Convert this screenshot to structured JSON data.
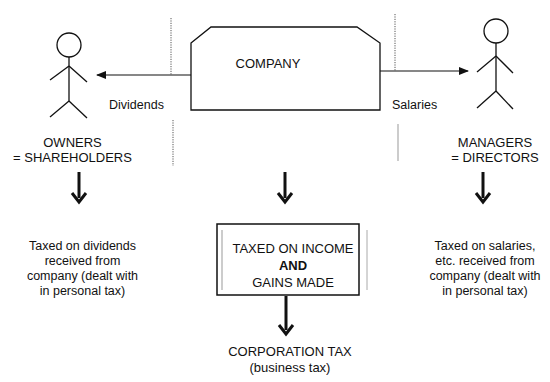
{
  "company": {
    "label": "COMPANY"
  },
  "flows": {
    "dividends_label": "Dividends",
    "salaries_label": "Salaries"
  },
  "owners": {
    "label_line1": "OWNERS",
    "label_line2": "= SHAREHOLDERS",
    "tax_lines": [
      "Taxed on dividends",
      "received from",
      "company (dealt with",
      "in personal tax)"
    ]
  },
  "managers": {
    "label_line1": "MANAGERS",
    "label_line2": "= DIRECTORS",
    "tax_lines": [
      "Taxed on salaries,",
      "etc. received from",
      "company (dealt with",
      "in personal tax)"
    ]
  },
  "company_tax_box": {
    "line1": "TAXED ON INCOME",
    "line2": "AND",
    "line3": "GAINS MADE"
  },
  "corporation_tax": {
    "line1": "CORPORATION TAX",
    "line2": "(business tax)"
  },
  "icons": {
    "owner_figure": "stick-figure",
    "manager_figure": "stick-figure",
    "arrows": "down-arrow"
  },
  "colors": {
    "stroke": "#111111",
    "dotted": "#555555",
    "faint": "#999999",
    "background": "#ffffff"
  }
}
